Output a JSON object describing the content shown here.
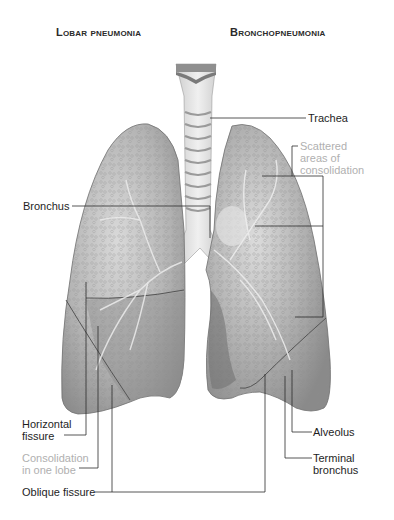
{
  "titles": {
    "left": "Lobar pneumonia",
    "right": "Bronchopneumonia"
  },
  "labels": {
    "trachea": "Trachea",
    "scattered": "Scattered\nareas of\nconsolidation",
    "bronchus": "Bronchus",
    "horizontal_fissure": "Horizontal\nfissure",
    "consolidation_one_lobe": "Consolidation\nin one lobe",
    "oblique_fissure": "Oblique fissure",
    "alveolus": "Alveolus",
    "terminal_bronchus": "Terminal\nbronchus"
  },
  "colors": {
    "label_text": "#1e1e1e",
    "highlight_label_text": "#b0b0b0",
    "leader_line": "#2b2b2b",
    "lung_fill": "#a9a9a9",
    "lung_light": "#d2d2d2",
    "trachea": "#e2e2e2"
  }
}
